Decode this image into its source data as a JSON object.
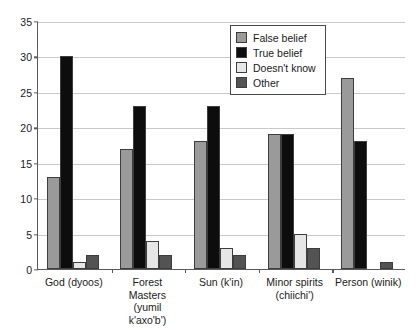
{
  "chart_data": {
    "type": "bar",
    "title": "",
    "subtitle": "",
    "xlabel": "",
    "ylabel": "",
    "ylim": [
      0,
      35
    ],
    "ytick_step": 5,
    "yticks": [
      0,
      5,
      10,
      15,
      20,
      25,
      30,
      35
    ],
    "grid": true,
    "legend_position": "top-right",
    "categories": [
      "God (dyoos)",
      "Forest Masters (yumil k'axo'b')",
      "Sun (k'in)",
      "Minor spirits (chiichi')",
      "Person (winik)"
    ],
    "category_lines": [
      [
        "God (dyoos)"
      ],
      [
        "Forest",
        "Masters",
        "(yumil",
        "k'axo'b')"
      ],
      [
        "Sun (k'in)"
      ],
      [
        "Minor spirits",
        "(chiichi')"
      ],
      [
        "Person (winik)"
      ]
    ],
    "series": [
      {
        "name": "False belief",
        "color": "#9a9a9a",
        "values": [
          13,
          17,
          18,
          19,
          27
        ]
      },
      {
        "name": "True belief",
        "color": "#0d0d0d",
        "values": [
          30,
          23,
          23,
          19,
          18
        ]
      },
      {
        "name": "Doesn't know",
        "color": "#e6e6e6",
        "values": [
          1,
          4,
          3,
          5,
          0
        ]
      },
      {
        "name": "Other",
        "color": "#535353",
        "values": [
          2,
          2,
          2,
          3,
          1
        ]
      }
    ]
  },
  "axis": {
    "tick_labels": [
      "0",
      "5",
      "10",
      "15",
      "20",
      "25",
      "30",
      "35"
    ]
  },
  "legend": {
    "entries": [
      {
        "label": "False belief",
        "color": "#9a9a9a"
      },
      {
        "label": "True belief",
        "color": "#0d0d0d"
      },
      {
        "label": "Doesn't know",
        "color": "#e6e6e6"
      },
      {
        "label": "Other",
        "color": "#535353"
      }
    ]
  },
  "colors": {
    "axis": "#5a5a5a",
    "grid": "#c9c9c9",
    "text": "#1a1a1a",
    "background": "#ffffff",
    "bar_outline": "#3d3d3d"
  }
}
